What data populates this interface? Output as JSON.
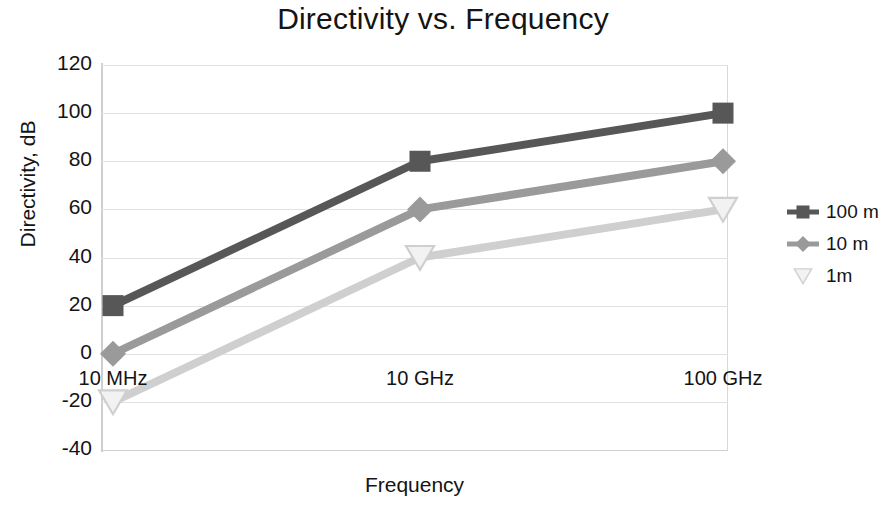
{
  "chart_data": {
    "type": "line",
    "title": "Directivity vs. Frequency",
    "xlabel": "Frequency",
    "ylabel": "Directivity, dB",
    "categories": [
      "10 MHz",
      "10 GHz",
      "100 GHz"
    ],
    "yticks": [
      120,
      100,
      80,
      60,
      40,
      20,
      0,
      -20,
      -40
    ],
    "ytick_labels": [
      "120",
      "100",
      "80",
      "60",
      "40",
      "20",
      "0",
      "-20",
      "-40"
    ],
    "ylim": [
      -40,
      120
    ],
    "grid": true,
    "legend_position": "right",
    "series": [
      {
        "name": "100 m",
        "values": [
          20,
          80,
          100
        ],
        "color": "#575757",
        "marker": "square"
      },
      {
        "name": "10 m",
        "values": [
          0,
          60,
          80
        ],
        "color": "#9a9a9a",
        "marker": "diamond"
      },
      {
        "name": "1m",
        "values": [
          -20,
          40,
          60
        ],
        "color": "#cfcfcf",
        "marker": "triangle-down"
      }
    ]
  },
  "axes": {
    "y_title": "Directivity, dB",
    "x_title": "Frequency"
  },
  "legend": {
    "items": [
      {
        "label": "100 m"
      },
      {
        "label": "10 m"
      },
      {
        "label": "1m"
      }
    ]
  },
  "colors": {
    "series_100m": "#575757",
    "series_10m": "#9a9a9a",
    "series_1m": "#cfcfcf",
    "grid": "#e2e2e2",
    "text": "#141414",
    "background": "#ffffff"
  }
}
